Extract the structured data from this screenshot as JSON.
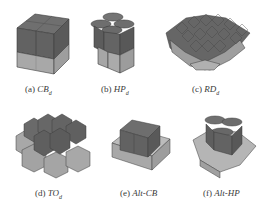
{
  "figure": {
    "panels": [
      {
        "id": "a",
        "label": "(a)",
        "name": "CB",
        "subscript": "d",
        "shape": "cube-blocks"
      },
      {
        "id": "b",
        "label": "(b)",
        "name": "HP",
        "subscript": "d",
        "shape": "hexagonal-prisms"
      },
      {
        "id": "c",
        "label": "(c)",
        "name": "RD",
        "subscript": "d",
        "shape": "rhombic-dodecahedra"
      },
      {
        "id": "d",
        "label": "(d)",
        "name": "TO",
        "subscript": "d",
        "shape": "truncated-octahedra"
      },
      {
        "id": "e",
        "label": "(e)",
        "name": "Alt-CB",
        "subscript": "",
        "shape": "alternating-cube-blocks"
      },
      {
        "id": "f",
        "label": "(f)",
        "name": "Alt-HP",
        "subscript": "",
        "shape": "alternating-hexagonal-prisms"
      }
    ],
    "colors": {
      "dark_top": "#6b6b6b",
      "dark_side": "#5e5e5e",
      "light_side": "#a9a9a9",
      "light_top": "#bdbdbd",
      "edge": "#3c3c3c",
      "light_edge": "#8a8a8a"
    }
  }
}
